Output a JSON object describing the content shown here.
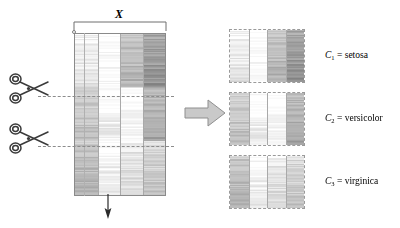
{
  "figure": {
    "title_symbol": "X"
  },
  "source_matrix": {
    "name": "X",
    "label": "X",
    "bracket": {
      "label": "X"
    },
    "origin_marker": "circle-marker",
    "columns": 4,
    "rows": 150,
    "border_color": "#8a8a8a",
    "column_shades": [
      {
        "index": 1,
        "base": "#dcdcdc"
      },
      {
        "index": 2,
        "base": "#fbfbfb"
      },
      {
        "index": 3,
        "base": "#b4b4b4"
      },
      {
        "index": 4,
        "base": "#9a9a9a"
      }
    ],
    "segments": [
      {
        "name": "setosa-band",
        "rows": 50,
        "shades": [
          "#ededed",
          "#fdfdfd",
          "#bcbcbc",
          "#9d9d9d"
        ]
      },
      {
        "name": "versicolor-band",
        "rows": 50,
        "shades": [
          "#c8c8c8",
          "#f6f6f6",
          "#fdfdfd",
          "#b0b0b0"
        ]
      },
      {
        "name": "virginica-band",
        "rows": 50,
        "shades": [
          "#bdbdbd",
          "#f2f2f2",
          "#e2e2e2",
          "#cfcfcf"
        ]
      }
    ],
    "down_arrow": "down-arrow"
  },
  "cut_lines": [
    {
      "name": "cut-line-1",
      "y": 96
    },
    {
      "name": "cut-line-2",
      "y": 146
    }
  ],
  "scissors": [
    {
      "name": "scissors-icon-1",
      "y": 70
    },
    {
      "name": "scissors-icon-2",
      "y": 120
    }
  ],
  "transform_arrow": {
    "name": "block-arrow",
    "direction": "right",
    "fill": "#c9c9c9",
    "stroke": "#8f8f8f"
  },
  "clusters": [
    {
      "id": "C1",
      "symbol": "C",
      "subscript": "1",
      "equals": " = ",
      "species": "setosa",
      "caption": "C₁ = setosa",
      "columns": 4,
      "rows": 50,
      "shades": [
        "#ededed",
        "#fdfdfd",
        "#bcbcbc",
        "#9d9d9d"
      ],
      "border_style": "dashed",
      "border_color": "#9a9a9a"
    },
    {
      "id": "C2",
      "symbol": "C",
      "subscript": "2",
      "equals": " = ",
      "species": "versicolor",
      "caption": "C₂ = versicolor",
      "columns": 4,
      "rows": 50,
      "shades": [
        "#c8c8c8",
        "#f6f6f6",
        "#fdfdfd",
        "#b0b0b0"
      ],
      "border_style": "dashed",
      "border_color": "#9a9a9a"
    },
    {
      "id": "C3",
      "symbol": "C",
      "subscript": "3",
      "equals": " = ",
      "species": "virginica",
      "caption": "C₃ = virginica",
      "columns": 4,
      "rows": 50,
      "shades": [
        "#bdbdbd",
        "#f2f2f2",
        "#e2e2e2",
        "#cfcfcf"
      ],
      "border_style": "dashed",
      "border_color": "#9a9a9a"
    }
  ]
}
